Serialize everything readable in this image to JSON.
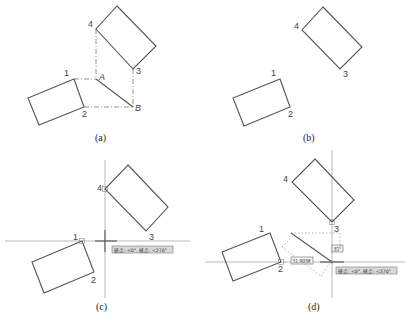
{
  "figure": {
    "panels": [
      {
        "id": "a",
        "caption": "(a)",
        "labels": {
          "p1": "1",
          "p2": "2",
          "p3": "3",
          "p4": "4",
          "A": "A",
          "B": "B"
        }
      },
      {
        "id": "b",
        "caption": "(b)",
        "labels": {
          "p1": "1",
          "p2": "2",
          "p3": "3",
          "p4": "4"
        }
      },
      {
        "id": "c",
        "caption": "(c)",
        "labels": {
          "p1": "1",
          "p2": "2",
          "p3": "3",
          "p4": "4"
        },
        "tooltip": "極点: <0°, 極点: <270°"
      },
      {
        "id": "d",
        "caption": "(d)",
        "labels": {
          "p1": "1",
          "p2": "2",
          "p3": "3",
          "p4": "4"
        },
        "tooltip": "極点: <0°, 極点: <270°",
        "dimension_length": "31.9038",
        "dimension_angle": "35°"
      }
    ],
    "colors": {
      "line": "#555555",
      "tooltip_bg": "#d9d9d9",
      "background": "#ffffff"
    }
  }
}
